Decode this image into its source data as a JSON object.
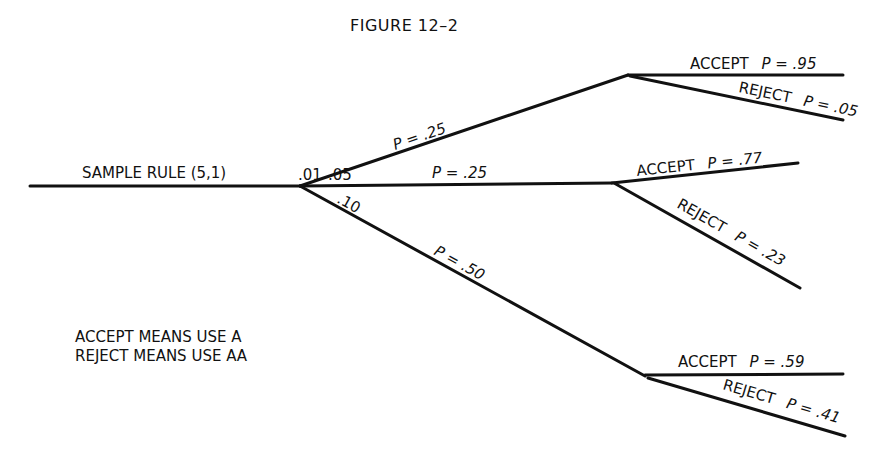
{
  "figure": {
    "title": "FIGURE 12–2"
  },
  "root": {
    "label": "SAMPLE RULE (5,1)"
  },
  "branches": [
    {
      "state": ".01",
      "prob_label": "P = .25",
      "outcomes": [
        {
          "label": "ACCEPT",
          "prob": "P = .95"
        },
        {
          "label": "REJECT",
          "prob": "P = .05"
        }
      ]
    },
    {
      "state": ".05",
      "prob_label": "P = .25",
      "outcomes": [
        {
          "label": "ACCEPT",
          "prob": "P = .77"
        },
        {
          "label": "REJECT",
          "prob": "P = .23"
        }
      ]
    },
    {
      "state": ".10",
      "prob_label": "P = .50",
      "outcomes": [
        {
          "label": "ACCEPT",
          "prob": "P = .59"
        },
        {
          "label": "REJECT",
          "prob": "P = .41"
        }
      ]
    }
  ],
  "legend": {
    "line1": "ACCEPT MEANS USE A",
    "line2": "REJECT MEANS USE AA"
  }
}
